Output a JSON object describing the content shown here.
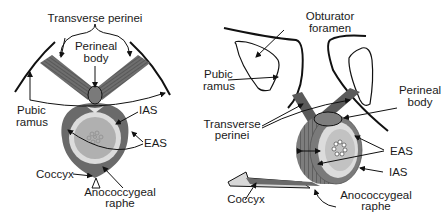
{
  "left_panel": {
    "labels": {
      "transverse_perinei": "Transverse perinei",
      "perineal_body_1": "Perineal",
      "perineal_body_2": "body",
      "pubic_ramus_1": "Pubic",
      "pubic_ramus_2": "ramus",
      "ias": "IAS",
      "eas": "EAS",
      "coccyx": "Coccyx",
      "anococcygeal_1": "Anococcygeal",
      "anococcygeal_2": "raphe"
    }
  },
  "right_panel": {
    "labels": {
      "obturator_1": "Obturator",
      "obturator_2": "foramen",
      "pubic_ramus_1": "Pubic",
      "pubic_ramus_2": "ramus",
      "perineal_body_1": "Perineal",
      "perineal_body_2": "body",
      "transverse_1": "Transverse",
      "transverse_2": "perinei",
      "eas": "EAS",
      "ias": "IAS",
      "coccyx": "Coccyx",
      "anococcygeal_1": "Anococcygeal",
      "anococcygeal_2": "raphe"
    }
  },
  "colors": {
    "muscle_dark": "#6b6b6b",
    "muscle_mid": "#8a8a8a",
    "ias_light": "#d8d8d8",
    "lumen": "#b4b4b4",
    "line": "#111111"
  }
}
